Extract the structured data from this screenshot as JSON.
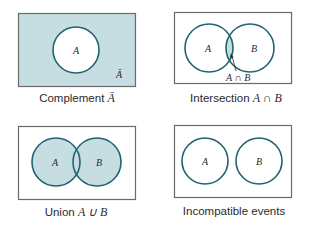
{
  "colors": {
    "shade": "#c6dde2",
    "circle_stroke": "#1f6470",
    "box_stroke": "#6a6a6a",
    "text": "#2a2a2a"
  },
  "panels": [
    {
      "id": "complement",
      "caption_text": "Complement ",
      "caption_math": "Ā",
      "circle_labels": [
        "A"
      ],
      "region_label": "Ā"
    },
    {
      "id": "intersection",
      "caption_text": "Intersection ",
      "caption_math": "A ∩ B",
      "circle_labels": [
        "A",
        "B"
      ],
      "pointer_label": "A ∩ B"
    },
    {
      "id": "union",
      "caption_text": "Union ",
      "caption_math": "A ∪ B",
      "circle_labels": [
        "A",
        "B"
      ]
    },
    {
      "id": "incompatible",
      "caption_text": "Incompatible events",
      "caption_math": "",
      "circle_labels": [
        "A",
        "B"
      ]
    }
  ]
}
